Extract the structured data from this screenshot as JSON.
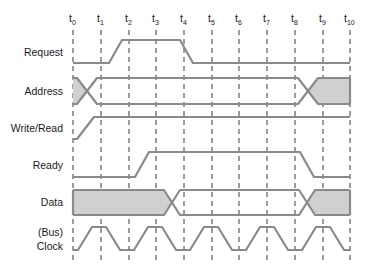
{
  "diagram": {
    "time_markers": [
      {
        "base": "t",
        "sub": "0",
        "x": 73
      },
      {
        "base": "t",
        "sub": "1",
        "x": 101
      },
      {
        "base": "t",
        "sub": "2",
        "x": 129
      },
      {
        "base": "t",
        "sub": "3",
        "x": 156
      },
      {
        "base": "t",
        "sub": "4",
        "x": 184
      },
      {
        "base": "t",
        "sub": "5",
        "x": 212
      },
      {
        "base": "t",
        "sub": "6",
        "x": 239
      },
      {
        "base": "t",
        "sub": "7",
        "x": 267
      },
      {
        "base": "t",
        "sub": "8",
        "x": 295
      },
      {
        "base": "t",
        "sub": "9",
        "x": 323
      },
      {
        "base": "t",
        "sub": "10",
        "x": 350
      }
    ],
    "signals": [
      {
        "id": "request",
        "label": "Request",
        "type": "level",
        "description": "Low until after t1, rises to high by t2, stays high through t4, falls low before t5, stays low to t10"
      },
      {
        "id": "address",
        "label": "Address",
        "type": "bus",
        "description": "Invalid (shaded) at t0, transitions to valid between t0 and t1, valid until ~t8, transitions after t8 to shaded (invalid) through t10"
      },
      {
        "id": "write_read",
        "label": "Write/Read",
        "type": "level",
        "description": "Low at t0, rises to high before t1, stays high through t10"
      },
      {
        "id": "ready",
        "label": "Ready",
        "type": "level",
        "description": "Low from t0 until after t2, rises to high by ~t3, stays high until t8, falls to low by t9"
      },
      {
        "id": "data",
        "label": "Data",
        "type": "bus",
        "description": "Shaded (driven data) from t0 to ~t3, crossover before t4, unshaded until t8, crossover, shaded through t10"
      },
      {
        "id": "clock",
        "label_line1": "(Bus)",
        "label_line2": "Clock",
        "type": "clock",
        "description": "Trapezoidal clock; high around t1, t3, t5, t7, t9; low around t0, t2, t4, t6, t8, t10"
      }
    ],
    "colors": {
      "signal_stroke": "#8a8a8a",
      "shaded_fill": "#d0d0d0",
      "grid_stroke": "#222222",
      "text": "#1a1a1a",
      "background": "#ffffff"
    }
  }
}
